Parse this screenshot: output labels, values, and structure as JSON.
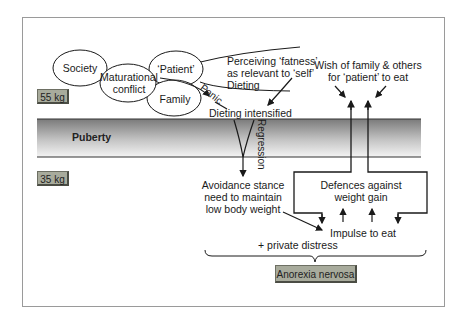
{
  "diagram": {
    "weights": {
      "upper": "55 kg",
      "lower": "35 kg"
    },
    "band": {
      "label": "Puberty"
    },
    "ellipses": {
      "society": "Society",
      "maturational": [
        "Maturational",
        "conflict"
      ],
      "patient": "‘Patient’",
      "family": "Family"
    },
    "labels": {
      "perceiving": [
        "Perceiving ‘fatness’",
        "as relevant to ‘self’",
        "Dieting"
      ],
      "panic": "Panic",
      "dieting_intensified": "Dieting intensified",
      "regression": "Regression",
      "wish": [
        "Wish of family & others",
        "for ‘patient’ to eat"
      ],
      "avoidance": [
        "Avoidance stance",
        "need to maintain",
        "low body weight"
      ],
      "defences": [
        "Defences against",
        "weight gain"
      ],
      "impulse": "Impulse to eat",
      "private_distress": "+ private distress"
    },
    "outcome": "Anorexia nervosa",
    "colors": {
      "band_dark": "#7c7c7c",
      "band_light": "#f2f2f2",
      "box_fill": "#a8ab9c",
      "line": "#1a1a1a"
    }
  }
}
